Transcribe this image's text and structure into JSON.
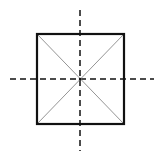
{
  "diagram": {
    "title": "",
    "colors": {
      "stroke": "#111111",
      "diagonal": "#888888",
      "background": "#ffffff"
    },
    "elements": [
      {
        "name": "square",
        "style": "solid-thick"
      },
      {
        "name": "diagonal-1",
        "style": "thin"
      },
      {
        "name": "diagonal-2",
        "style": "thin"
      },
      {
        "name": "vertical-axis",
        "style": "dashed"
      },
      {
        "name": "horizontal-axis",
        "style": "dashed"
      }
    ]
  }
}
